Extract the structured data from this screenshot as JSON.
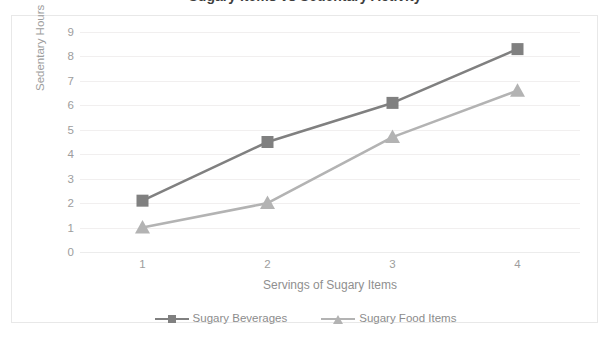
{
  "chart_data": {
    "type": "line",
    "title": "Sugary Items vs Sedentary Activity",
    "xlabel": "Servings of Sugary Items",
    "ylabel": "Sedentary Hours",
    "categories": [
      "1",
      "2",
      "3",
      "4"
    ],
    "yticks": [
      "0",
      "1",
      "2",
      "3",
      "4",
      "5",
      "6",
      "7",
      "8",
      "9"
    ],
    "ylim": [
      0,
      9
    ],
    "grid": true,
    "legend_position": "bottom",
    "series": [
      {
        "name": "Sugary Beverages",
        "marker": "square",
        "color": "#808080",
        "values": [
          2.1,
          4.5,
          6.1,
          8.3
        ]
      },
      {
        "name": "Sugary Food Items",
        "marker": "triangle",
        "color": "#b3b3b3",
        "values": [
          1.0,
          2.0,
          4.7,
          6.6
        ]
      }
    ]
  },
  "colors": {
    "series_beverages": "#808080",
    "series_food": "#b3b3b3",
    "gridline": "#f1efef",
    "axis_text": "#9d9d9d",
    "frame_border": "#e8e8e8",
    "title_text": "#3d3d3d",
    "background": "#ffffff"
  },
  "axis": {
    "y_title": "Sedentary Hours",
    "x_title": "Servings of Sugary Items"
  },
  "legend": {
    "items": [
      {
        "label": "Sugary Beverages"
      },
      {
        "label": "Sugary Food Items"
      }
    ]
  }
}
